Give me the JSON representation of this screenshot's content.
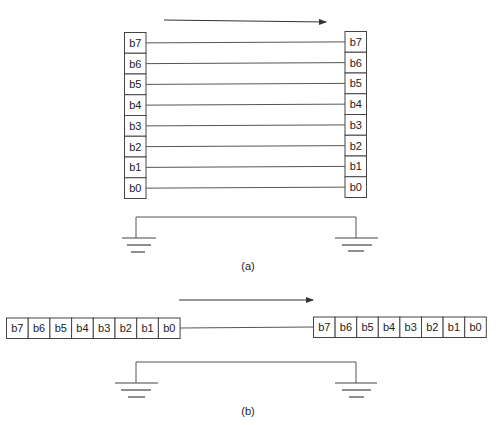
{
  "figure_a": {
    "caption": "(a)",
    "title": "Parallel transmission",
    "sender_bits": [
      "b7",
      "b6",
      "b5",
      "b4",
      "b3",
      "b2",
      "b1",
      "b0"
    ],
    "receiver_bits": [
      "b7",
      "b6",
      "b5",
      "b4",
      "b3",
      "b2",
      "b1",
      "b0"
    ],
    "direction": "left-to-right"
  },
  "figure_b": {
    "caption": "(b)",
    "title": "Serial transmission",
    "sender_bits": [
      "b7",
      "b6",
      "b5",
      "b4",
      "b3",
      "b2",
      "b1",
      "b0"
    ],
    "receiver_bits": [
      "b7",
      "b6",
      "b5",
      "b4",
      "b3",
      "b2",
      "b1",
      "b0"
    ],
    "direction": "left-to-right"
  },
  "icons": {
    "ground": "ground-symbol-icon",
    "arrow": "arrow-right-icon"
  },
  "colors": {
    "line": "#555555",
    "box": "#444444",
    "background": "#ffffff"
  }
}
